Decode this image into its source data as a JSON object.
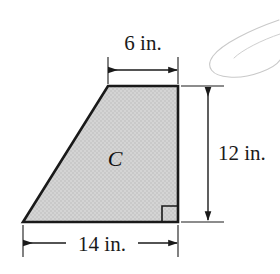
{
  "figure": {
    "shape": {
      "name": "trapezoid",
      "label": "C",
      "fill_color": "#d2d2d2",
      "stroke_color": "#1a1a1a",
      "vertices_px": [
        [
          108,
          86
        ],
        [
          178,
          86
        ],
        [
          178,
          222
        ],
        [
          23,
          222
        ]
      ],
      "right_angle_marker": {
        "at_vertex_px": [
          178,
          222
        ],
        "size_px": 16,
        "shown": true
      }
    },
    "dimensions": [
      {
        "id": "top-width",
        "label": "6 in.",
        "value": 6,
        "unit": "in.",
        "orientation": "horizontal",
        "edge": "top"
      },
      {
        "id": "right-height",
        "label": "12 in.",
        "value": 12,
        "unit": "in.",
        "orientation": "vertical",
        "edge": "right"
      },
      {
        "id": "bottom-width",
        "label": "14 in.",
        "value": 14,
        "unit": "in.",
        "orientation": "horizontal",
        "edge": "bottom"
      }
    ],
    "artifact": {
      "name": "scan-artifact-loop",
      "color": "#c9c9c9",
      "description": "faint light gray elongated loop partially cropped at the upper right corner"
    },
    "colors": {
      "ink": "#1a1a1a",
      "fill": "#d2d2d2",
      "artifact": "#c9c9c9",
      "background": "#ffffff"
    }
  }
}
